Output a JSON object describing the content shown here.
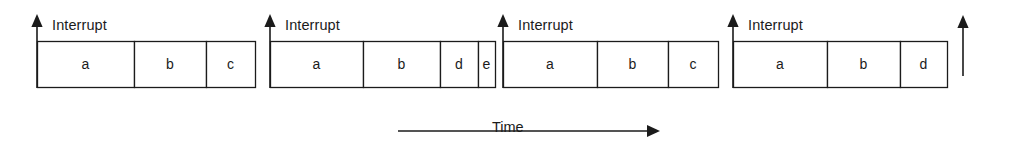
{
  "diagram": {
    "background_color": "#ffffff",
    "stroke_color": "#1b1b1b",
    "axis_label": "Time",
    "interrupt_label": "Interrupt",
    "time_axis": {
      "label": "Time",
      "x_start": 398,
      "x_end": 660,
      "y": 131,
      "label_x": 492,
      "label_y": 120
    },
    "groups": [
      {
        "id": "group-1",
        "interrupt_label": "Interrupt",
        "arrow_x": 37,
        "arrow_top": 14,
        "arrow_bottom": 88,
        "label_x": 52,
        "label_y": 18,
        "box_top": 41,
        "box_bottom": 87,
        "boxes": [
          {
            "label": "a",
            "x": 37,
            "width": 97
          },
          {
            "label": "b",
            "x": 134,
            "width": 72
          },
          {
            "label": "c",
            "x": 206,
            "width": 49
          }
        ]
      },
      {
        "id": "group-2",
        "interrupt_label": "Interrupt",
        "arrow_x": 270,
        "arrow_top": 14,
        "arrow_bottom": 88,
        "label_x": 285,
        "label_y": 18,
        "box_top": 41,
        "box_bottom": 87,
        "boxes": [
          {
            "label": "a",
            "x": 270,
            "width": 93
          },
          {
            "label": "b",
            "x": 363,
            "width": 77
          },
          {
            "label": "d",
            "x": 440,
            "width": 38
          },
          {
            "label": "e",
            "x": 478,
            "width": 17
          }
        ]
      },
      {
        "id": "group-3",
        "interrupt_label": "Interrupt",
        "arrow_x": 503,
        "arrow_top": 14,
        "arrow_bottom": 88,
        "label_x": 518,
        "label_y": 18,
        "box_top": 41,
        "box_bottom": 87,
        "boxes": [
          {
            "label": "a",
            "x": 503,
            "width": 94
          },
          {
            "label": "b",
            "x": 597,
            "width": 71
          },
          {
            "label": "c",
            "x": 668,
            "width": 50
          }
        ]
      },
      {
        "id": "group-4",
        "interrupt_label": "Interrupt",
        "arrow_x": 733,
        "arrow_top": 14,
        "arrow_bottom": 88,
        "label_x": 748,
        "label_y": 18,
        "box_top": 41,
        "box_bottom": 87,
        "boxes": [
          {
            "label": "a",
            "x": 733,
            "width": 94
          },
          {
            "label": "b",
            "x": 827,
            "width": 73
          },
          {
            "label": "d",
            "x": 900,
            "width": 47
          }
        ]
      }
    ],
    "trailing_arrow": {
      "id": "trailing-arrow",
      "x": 963,
      "top": 15,
      "bottom": 76,
      "label": ""
    }
  }
}
